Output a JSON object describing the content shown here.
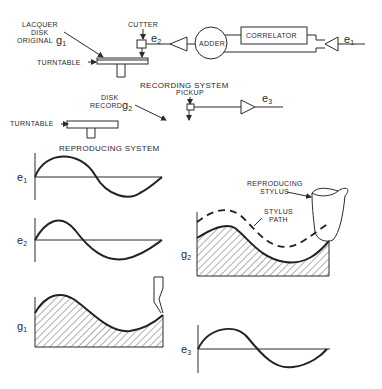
{
  "recording_system": {
    "title": "RECORDING SYSTEM",
    "lacquer_label_line1": "LACQUER",
    "lacquer_label_line2": "DISK",
    "lacquer_label_line3": "ORIGINAL",
    "lacquer_symbol": "g",
    "lacquer_symbol_sub": "1",
    "cutter_label": "CUTTER",
    "turntable_label": "TURNTABLE",
    "signal_e2": "e",
    "signal_e2_sub": "2",
    "adder_label": "ADDER",
    "correlator_label": "CORRELATOR",
    "signal_e1": "e",
    "signal_e1_sub": "1"
  },
  "reproducing_system": {
    "title": "REPRODUCING SYSTEM",
    "disk_label_line1": "DISK",
    "disk_label_line2": "RECORD",
    "disk_symbol": "g",
    "disk_symbol_sub": "2",
    "pickup_label": "PICKUP",
    "turntable_label": "TURNTABLE",
    "signal_e3": "e",
    "signal_e3_sub": "3"
  },
  "waveforms": {
    "e1": {
      "symbol": "e",
      "sub": "1"
    },
    "e2": {
      "symbol": "e",
      "sub": "2"
    },
    "g1": {
      "symbol": "g",
      "sub": "1"
    },
    "g2": {
      "symbol": "g",
      "sub": "2",
      "stylus_label_line1": "REPRODUCING",
      "stylus_label_line2": "STYLUS",
      "path_label_line1": "STYLUS",
      "path_label_line2": "PATH"
    },
    "e3": {
      "symbol": "e",
      "sub": "3"
    }
  },
  "colors": {
    "ink": "#2a2a2a",
    "background": "#ffffff"
  }
}
